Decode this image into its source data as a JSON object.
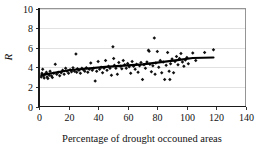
{
  "chart_data": {
    "type": "scatter",
    "title": "",
    "xlabel": "Percentage of drought occouned areas",
    "ylabel": "R",
    "xlim": [
      0,
      140
    ],
    "ylim": [
      0,
      10
    ],
    "xticks": [
      0,
      20,
      40,
      60,
      80,
      100,
      120,
      140
    ],
    "yticks": [
      0,
      2,
      4,
      6,
      8,
      10
    ],
    "xtick_labels": [
      "0",
      "20",
      "40",
      "60",
      "80",
      "100",
      "120",
      "140"
    ],
    "ytick_labels": [
      "0",
      "2",
      "4",
      "6",
      "8",
      "10"
    ],
    "grid": "horizontal",
    "legend": "none",
    "marker": "diamond",
    "marker_color": "#111111",
    "gridline_color": "#d4d4d4",
    "axis_color": "#1a1a1a",
    "frame_color": "#7a7a7a",
    "background_color": "#ffffff",
    "series": [
      {
        "name": "observations",
        "type": "scatter",
        "points": [
          [
            1.5,
            3.0
          ],
          [
            2.0,
            3.4
          ],
          [
            2.5,
            3.8
          ],
          [
            3.0,
            3.1
          ],
          [
            3.5,
            2.9
          ],
          [
            4.0,
            3.3
          ],
          [
            5.0,
            3.5
          ],
          [
            5.5,
            3.0
          ],
          [
            6.0,
            2.85
          ],
          [
            7.0,
            3.2
          ],
          [
            7.5,
            3.6
          ],
          [
            8.5,
            3.1
          ],
          [
            9.0,
            2.95
          ],
          [
            10.0,
            3.4
          ],
          [
            11.0,
            4.3
          ],
          [
            12.0,
            3.3
          ],
          [
            13.0,
            3.5
          ],
          [
            14.0,
            3.15
          ],
          [
            15.0,
            3.45
          ],
          [
            16.0,
            3.7
          ],
          [
            17.0,
            3.3
          ],
          [
            18.0,
            3.9
          ],
          [
            19.0,
            3.6
          ],
          [
            20.0,
            3.4
          ],
          [
            21.0,
            3.75
          ],
          [
            22.0,
            3.55
          ],
          [
            23.0,
            3.95
          ],
          [
            24.0,
            3.6
          ],
          [
            25.0,
            5.35
          ],
          [
            25.5,
            3.5
          ],
          [
            26.0,
            3.85
          ],
          [
            27.0,
            3.7
          ],
          [
            28.0,
            3.4
          ],
          [
            29.0,
            3.9
          ],
          [
            30.0,
            3.75
          ],
          [
            31.0,
            3.6
          ],
          [
            32.0,
            3.95
          ],
          [
            33.0,
            3.5
          ],
          [
            34.0,
            3.8
          ],
          [
            35.0,
            4.45
          ],
          [
            36.0,
            3.7
          ],
          [
            37.0,
            3.9
          ],
          [
            38.0,
            2.6
          ],
          [
            39.0,
            3.6
          ],
          [
            40.0,
            4.6
          ],
          [
            41.0,
            3.8
          ],
          [
            42.0,
            4.0
          ],
          [
            43.0,
            3.45
          ],
          [
            44.0,
            3.9
          ],
          [
            45.0,
            4.7
          ],
          [
            46.0,
            3.7
          ],
          [
            47.0,
            4.1
          ],
          [
            48.0,
            3.9
          ],
          [
            49.0,
            3.2
          ],
          [
            50.0,
            6.1
          ],
          [
            50.5,
            4.9
          ],
          [
            51.0,
            4.2
          ],
          [
            52.0,
            3.9
          ],
          [
            53.0,
            3.3
          ],
          [
            54.0,
            4.5
          ],
          [
            55.0,
            4.1
          ],
          [
            56.0,
            3.85
          ],
          [
            57.0,
            4.7
          ],
          [
            58.0,
            4.25
          ],
          [
            59.0,
            3.9
          ],
          [
            60.0,
            4.4
          ],
          [
            61.0,
            4.05
          ],
          [
            62.0,
            3.4
          ],
          [
            63.0,
            4.6
          ],
          [
            64.0,
            4.1
          ],
          [
            65.0,
            3.8
          ],
          [
            66.0,
            4.3
          ],
          [
            67.0,
            3.5
          ],
          [
            68.0,
            4.15
          ],
          [
            69.0,
            4.5
          ],
          [
            70.0,
            2.75
          ],
          [
            71.0,
            4.25
          ],
          [
            72.0,
            3.9
          ],
          [
            73.0,
            4.55
          ],
          [
            74.0,
            5.75
          ],
          [
            74.5,
            5.65
          ],
          [
            75.0,
            4.3
          ],
          [
            76.0,
            3.55
          ],
          [
            77.0,
            4.15
          ],
          [
            78.0,
            7.0
          ],
          [
            78.5,
            3.3
          ],
          [
            79.0,
            4.45
          ],
          [
            80.0,
            5.6
          ],
          [
            81.0,
            4.0
          ],
          [
            82.0,
            4.7
          ],
          [
            83.0,
            3.45
          ],
          [
            84.0,
            4.55
          ],
          [
            85.0,
            2.75
          ],
          [
            86.0,
            4.2
          ],
          [
            87.0,
            5.5
          ],
          [
            88.0,
            3.6
          ],
          [
            88.5,
            2.75
          ],
          [
            89.0,
            4.35
          ],
          [
            90.0,
            4.85
          ],
          [
            91.0,
            3.45
          ],
          [
            92.0,
            4.6
          ],
          [
            93.0,
            5.1
          ],
          [
            94.0,
            4.25
          ],
          [
            95.0,
            4.9
          ],
          [
            96.0,
            5.4
          ],
          [
            97.0,
            4.55
          ],
          [
            98.0,
            4.1
          ],
          [
            99.0,
            4.75
          ],
          [
            100.0,
            5.0
          ],
          [
            101.0,
            4.35
          ],
          [
            104.0,
            5.45
          ],
          [
            106.0,
            4.7
          ],
          [
            112.0,
            5.5
          ],
          [
            118.0,
            5.8
          ]
        ]
      },
      {
        "name": "trend",
        "type": "line",
        "points": [
          [
            1.5,
            3.2
          ],
          [
            20,
            3.7
          ],
          [
            45,
            4.05
          ],
          [
            70,
            4.3
          ],
          [
            95,
            4.75
          ],
          [
            104,
            4.95
          ],
          [
            118,
            5.0
          ]
        ]
      }
    ]
  }
}
